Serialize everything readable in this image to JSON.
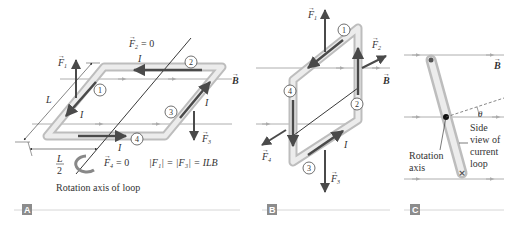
{
  "figure": {
    "panels": [
      {
        "tag": "A",
        "labels": {
          "F1": "F",
          "F1_sub": "1",
          "F2_eq": "= 0",
          "F2": "F",
          "F2_sub": "2",
          "F3": "F",
          "F3_sub": "3",
          "F4": "F",
          "F4_sub": "4",
          "F4_eq": "= 0",
          "B": "B",
          "I": "I",
          "L": "L",
          "half_num": "L",
          "half_den": "2",
          "magnitude_eq": "|F₁| = |F₃| = ILB",
          "caption": "Rotation axis of loop",
          "segments": [
            "1",
            "2",
            "3",
            "4"
          ]
        }
      },
      {
        "tag": "B",
        "labels": {
          "F1": "F",
          "F1_sub": "1",
          "F2": "F",
          "F2_sub": "2",
          "F3": "F",
          "F3_sub": "3",
          "F4": "F",
          "F4_sub": "4",
          "B": "B",
          "I": "I",
          "segments": [
            "1",
            "2",
            "3",
            "4"
          ]
        }
      },
      {
        "tag": "C",
        "labels": {
          "B": "B",
          "theta": "θ",
          "side_view": [
            "Side",
            "view of",
            "current",
            "loop"
          ],
          "rotation_axis": [
            "Rotation",
            "axis"
          ]
        }
      }
    ],
    "colors": {
      "loop_fill": "#e6e6e6",
      "loop_edge": "#b8b8b8",
      "current_arrow": "#4a4a4a",
      "field_line": "#9a9a9a",
      "tag_bg": "#8c8c8c",
      "text": "#333333"
    }
  }
}
